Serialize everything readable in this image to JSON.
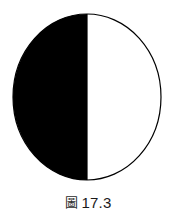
{
  "canvas": {
    "width": 176,
    "height": 216,
    "background": "#ffffff"
  },
  "figure": {
    "name": "half-shaded-circle",
    "center_x": 87,
    "center_y": 97,
    "radius_x": 74,
    "radius_y": 83,
    "outline_color": "#000000",
    "outline_width": 1,
    "filled_half": "left",
    "fill_color": "#000000",
    "unfilled_color": "#ffffff",
    "divider_x": 87,
    "divider_color": "#000000"
  },
  "caption": {
    "symbol": "圖",
    "symbol_icon_name": "figure-label-cjk-icon",
    "number": "17.3",
    "full_text": "圖 17.3"
  }
}
